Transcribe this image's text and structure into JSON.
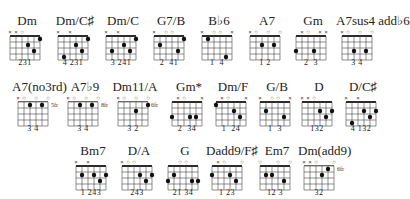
{
  "chords": [
    {
      "name": "Dm",
      "x": 4,
      "y": 14,
      "markers": "xxo   ",
      "dots": [
        [
          3,
          2
        ],
        [
          4,
          3
        ],
        [
          5,
          1
        ]
      ],
      "fingers": "231",
      "fret": ""
    },
    {
      "name": "Dm/C♯",
      "x": 52,
      "y": 14,
      "markers": "x x   ",
      "dots": [
        [
          1,
          4
        ],
        [
          3,
          2
        ],
        [
          4,
          3
        ],
        [
          5,
          1
        ]
      ],
      "fingers": "4 231",
      "fret": ""
    },
    {
      "name": "Dm/C",
      "x": 100,
      "y": 14,
      "markers": "x x   ",
      "dots": [
        [
          1,
          3
        ],
        [
          3,
          2
        ],
        [
          4,
          3
        ],
        [
          5,
          1
        ]
      ],
      "fingers": "3 241",
      "fret": ""
    },
    {
      "name": "G7/B",
      "x": 148,
      "y": 14,
      "markers": "x oo  ",
      "dots": [
        [
          1,
          2
        ],
        [
          4,
          3
        ],
        [
          5,
          1
        ]
      ],
      "fingers": "2  41",
      "fret": ""
    },
    {
      "name": "B♭6",
      "x": 196,
      "y": 14,
      "markers": "x oo x",
      "dots": [
        [
          1,
          1
        ],
        [
          4,
          4
        ]
      ],
      "fingers": "1  4",
      "fret": ""
    },
    {
      "name": "A7",
      "x": 244,
      "y": 14,
      "markers": "xo o o",
      "dots": [
        [
          2,
          2
        ],
        [
          4,
          2
        ]
      ],
      "fingers": "1 2",
      "fret": ""
    },
    {
      "name": "Gm",
      "x": 290,
      "y": 14,
      "markers": " xo xx",
      "dots": [
        [
          0,
          3
        ],
        [
          3,
          3
        ]
      ],
      "fingers": "2  3",
      "fret": ""
    },
    {
      "name": "A7sus4 add♭6",
      "x": 336,
      "y": 14,
      "markers": "xo o o",
      "dots": [
        [
          2,
          3
        ],
        [
          4,
          3
        ]
      ],
      "fingers": "3 4",
      "fret": ""
    },
    {
      "name": "A7(no3rd)",
      "x": 12,
      "y": 80,
      "markers": "xo o o",
      "dots": [
        [
          2,
          1
        ],
        [
          4,
          1
        ]
      ],
      "fingers": "3 4",
      "fret": "5fr"
    },
    {
      "name": "A7♭9",
      "x": 62,
      "y": 80,
      "markers": "xo o o",
      "dots": [
        [
          2,
          1
        ],
        [
          4,
          1
        ]
      ],
      "fingers": "3 4",
      "fret": "8fr"
    },
    {
      "name": "Dm11/A",
      "x": 112,
      "y": 80,
      "markers": "xo o o",
      "dots": [
        [
          3,
          2
        ],
        [
          5,
          1
        ]
      ],
      "fingers": "3 2",
      "fret": "6fr"
    },
    {
      "name": "Gm*",
      "x": 166,
      "y": 80,
      "markers": " xo  x",
      "dots": [
        [
          0,
          3
        ],
        [
          3,
          3
        ],
        [
          4,
          3
        ]
      ],
      "fingers": "2  34",
      "fret": ""
    },
    {
      "name": "Dm/F",
      "x": 210,
      "y": 80,
      "markers": " xo  x",
      "dots": [
        [
          0,
          1
        ],
        [
          3,
          2
        ],
        [
          4,
          3
        ]
      ],
      "fingers": "1  24",
      "fret": ""
    },
    {
      "name": "G/B",
      "x": 254,
      "y": 80,
      "markers": "x oo x",
      "dots": [
        [
          1,
          2
        ],
        [
          4,
          3
        ]
      ],
      "fingers": "1  3",
      "fret": ""
    },
    {
      "name": "D",
      "x": 296,
      "y": 80,
      "markers": "xxo   ",
      "dots": [
        [
          3,
          2
        ],
        [
          4,
          3
        ],
        [
          5,
          2
        ]
      ],
      "fingers": "132",
      "fret": ""
    },
    {
      "name": "D/C♯",
      "x": 340,
      "y": 80,
      "markers": "x x   ",
      "dots": [
        [
          1,
          4
        ],
        [
          3,
          2
        ],
        [
          4,
          3
        ],
        [
          5,
          2
        ]
      ],
      "fingers": "4 132",
      "fret": ""
    },
    {
      "name": "Bm7",
      "x": 70,
      "y": 144,
      "markers": "x x   ",
      "dots": [
        [
          1,
          2
        ],
        [
          3,
          2
        ],
        [
          4,
          3
        ],
        [
          5,
          2
        ]
      ],
      "fingers": "1 243",
      "fret": ""
    },
    {
      "name": "D/A",
      "x": 116,
      "y": 144,
      "markers": "xoo   ",
      "dots": [
        [
          3,
          2
        ],
        [
          4,
          3
        ],
        [
          5,
          2
        ]
      ],
      "fingers": "243",
      "fret": ""
    },
    {
      "name": "G",
      "x": 162,
      "y": 144,
      "markers": "  oo  ",
      "dots": [
        [
          0,
          3
        ],
        [
          1,
          2
        ],
        [
          4,
          3
        ],
        [
          5,
          3
        ]
      ],
      "fingers": "21 34",
      "fret": ""
    },
    {
      "name": "Dadd9/F♯",
      "x": 206,
      "y": 144,
      "markers": " xo  o",
      "dots": [
        [
          0,
          2
        ],
        [
          3,
          2
        ],
        [
          4,
          3
        ]
      ],
      "fingers": "1 23",
      "fret": ""
    },
    {
      "name": "Em7",
      "x": 254,
      "y": 144,
      "markers": "o  o o",
      "dots": [
        [
          1,
          2
        ],
        [
          2,
          2
        ],
        [
          4,
          3
        ]
      ],
      "fingers": "12 3",
      "fret": ""
    },
    {
      "name": "Dm(add9)",
      "x": 298,
      "y": 144,
      "markers": "xxo  o",
      "dots": [
        [
          3,
          2
        ],
        [
          4,
          1
        ]
      ],
      "fingers": "32",
      "fret": "6fr"
    }
  ]
}
